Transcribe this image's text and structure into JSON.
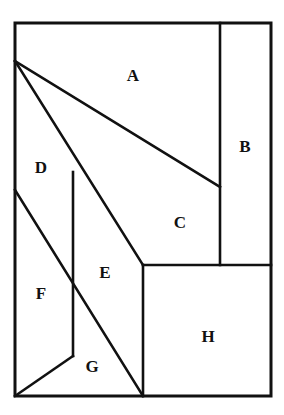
{
  "figure": {
    "canvas": {
      "width": 284,
      "height": 415
    },
    "colors": {
      "line": "#111111",
      "background": "#ffffff",
      "label": "#111111"
    },
    "outer_rect": {
      "x1": 15,
      "y1": 23,
      "x2": 271,
      "y2": 396
    },
    "vertices": {
      "top_left": [
        15,
        23
      ],
      "top_right": [
        271,
        23
      ],
      "bottom_right": [
        271,
        396
      ],
      "bottom_left": [
        15,
        396
      ],
      "apex": [
        15,
        61
      ],
      "b_divider_top": [
        220,
        23
      ],
      "b_divider_bottom": [
        220,
        265
      ],
      "ac_diagonal_end": [
        220,
        187
      ],
      "mid_corner": [
        143,
        265
      ],
      "h_left_bottom": [
        143,
        396
      ],
      "de_vertical_top": [
        73,
        172
      ],
      "de_vertical_bottom": [
        73,
        356
      ],
      "f_diagonal_start": [
        15,
        190
      ],
      "right_mid": [
        271,
        265
      ]
    },
    "edges": [
      {
        "name": "outer-rectangle",
        "type": "rect",
        "points": [
          [
            15,
            23
          ],
          [
            271,
            23
          ],
          [
            271,
            396
          ],
          [
            15,
            396
          ]
        ]
      },
      {
        "name": "b-vertical-divider",
        "type": "line",
        "points": [
          [
            220,
            23
          ],
          [
            220,
            265
          ]
        ]
      },
      {
        "name": "mid-horizontal-divider",
        "type": "line",
        "points": [
          [
            143,
            265
          ],
          [
            271,
            265
          ]
        ]
      },
      {
        "name": "h-left-vertical",
        "type": "line",
        "points": [
          [
            143,
            265
          ],
          [
            143,
            396
          ]
        ]
      },
      {
        "name": "a-c-diagonal",
        "type": "line",
        "points": [
          [
            15,
            61
          ],
          [
            220,
            187
          ]
        ]
      },
      {
        "name": "c-e-diagonal",
        "type": "line",
        "points": [
          [
            15,
            61
          ],
          [
            143,
            265
          ]
        ]
      },
      {
        "name": "e-g-diagonal",
        "type": "line",
        "points": [
          [
            143,
            265
          ],
          [
            143,
            396
          ]
        ]
      },
      {
        "name": "d-e-vertical",
        "type": "line",
        "points": [
          [
            73,
            172
          ],
          [
            73,
            356
          ]
        ]
      },
      {
        "name": "d-f-diagonal",
        "type": "line",
        "points": [
          [
            15,
            190
          ],
          [
            143,
            396
          ]
        ]
      },
      {
        "name": "f-g-diagonal",
        "type": "line",
        "points": [
          [
            73,
            356
          ],
          [
            15,
            396
          ]
        ]
      }
    ],
    "regions": [
      {
        "id": "A",
        "label": "A",
        "label_x": 133,
        "label_y": 77,
        "name": "region-a"
      },
      {
        "id": "B",
        "label": "B",
        "label_x": 245,
        "label_y": 148,
        "name": "region-b"
      },
      {
        "id": "C",
        "label": "C",
        "label_x": 180,
        "label_y": 224,
        "name": "region-c"
      },
      {
        "id": "D",
        "label": "D",
        "label_x": 41,
        "label_y": 169,
        "name": "region-d"
      },
      {
        "id": "E",
        "label": "E",
        "label_x": 105,
        "label_y": 274,
        "name": "region-e"
      },
      {
        "id": "F",
        "label": "F",
        "label_x": 41,
        "label_y": 295,
        "name": "region-f"
      },
      {
        "id": "G",
        "label": "G",
        "label_x": 92,
        "label_y": 368,
        "name": "region-g"
      },
      {
        "id": "H",
        "label": "H",
        "label_x": 208,
        "label_y": 338,
        "name": "region-h"
      }
    ]
  }
}
